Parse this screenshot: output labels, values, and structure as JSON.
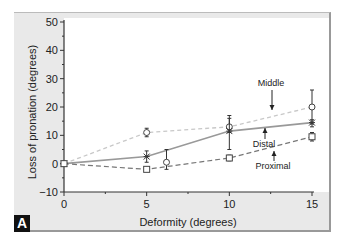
{
  "chart_data": {
    "type": "line",
    "title": "",
    "panel_label": "A",
    "xlabel": "Deformity (degrees)",
    "ylabel": "Loss of pronation (degrees)",
    "xlim": [
      0,
      15
    ],
    "ylim": [
      -10,
      50
    ],
    "xticks": [
      0,
      5,
      10,
      15
    ],
    "yticks": [
      -10,
      0,
      10,
      20,
      30,
      40,
      50
    ],
    "grid": false,
    "legend": "inline annotations with arrows",
    "x": [
      0,
      5,
      10,
      15
    ],
    "series": [
      {
        "name": "Middle",
        "style": "dashed-light",
        "marker": "circle",
        "values": [
          0,
          11,
          13,
          20
        ],
        "err_low": [
          0,
          9.5,
          11,
          14
        ],
        "err_high": [
          0,
          12.5,
          17,
          26
        ]
      },
      {
        "name": "Distal",
        "style": "solid",
        "marker": "star",
        "values": [
          0,
          2.5,
          11.5,
          14.5
        ],
        "err_low": [
          0,
          0.5,
          5,
          13
        ],
        "err_high": [
          0,
          4.5,
          16,
          15.5
        ]
      },
      {
        "name": "Proximal",
        "style": "dashed-dark",
        "marker": "square",
        "values": [
          0,
          -2,
          2,
          9.5
        ],
        "err_low": [
          0,
          -2.5,
          1,
          8
        ],
        "err_high": [
          0,
          -1.5,
          3,
          11
        ]
      }
    ],
    "extra_points": [
      {
        "x": 6.2,
        "y": 0.5,
        "marker": "circle",
        "err_low": -2,
        "err_high": 5
      }
    ],
    "annotations": [
      {
        "text": "Middle",
        "arrow": "down"
      },
      {
        "text": "Distal",
        "arrow": "up"
      },
      {
        "text": "Proximal",
        "arrow": "up"
      }
    ]
  },
  "labels": {
    "panel": "A",
    "xlabel": "Deformity (degrees)",
    "ylabel": "Loss of pronation (degrees)",
    "middle": "Middle",
    "distal": "Distal",
    "proximal": "Proximal"
  }
}
